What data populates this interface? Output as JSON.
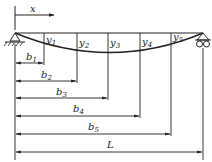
{
  "diagram": {
    "axis_label": "x",
    "deflection_labels": [
      {
        "main": "y",
        "sub": "1"
      },
      {
        "main": "y",
        "sub": "2"
      },
      {
        "main": "y",
        "sub": "3"
      },
      {
        "main": "y",
        "sub": "4"
      },
      {
        "main": "y",
        "sub": "5"
      }
    ],
    "dimension_labels": [
      {
        "main": "b",
        "sub": "1"
      },
      {
        "main": "b",
        "sub": "2"
      },
      {
        "main": "b",
        "sub": "3"
      },
      {
        "main": "b",
        "sub": "4"
      },
      {
        "main": "b",
        "sub": "5"
      },
      {
        "main": "L",
        "sub": ""
      }
    ],
    "supports": {
      "left": "pinned support",
      "right": "roller support"
    },
    "line_color": "#222222"
  }
}
